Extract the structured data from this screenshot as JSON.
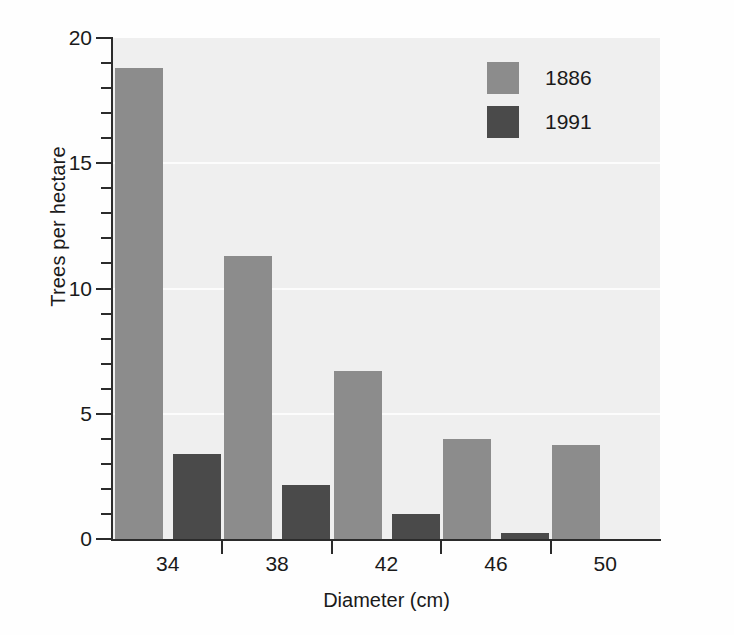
{
  "chart_data": {
    "type": "bar",
    "title": "",
    "xlabel": "Diameter (cm)",
    "ylabel": "Trees per hectare",
    "categories": [
      "34",
      "38",
      "42",
      "46",
      "50"
    ],
    "series": [
      {
        "name": "1886",
        "color": "#8c8c8c",
        "values": [
          18.8,
          11.3,
          6.7,
          4.0,
          3.75
        ]
      },
      {
        "name": "1991",
        "color": "#4a4a4a",
        "values": [
          3.4,
          2.15,
          1.0,
          0.25,
          0
        ]
      }
    ],
    "ylim": [
      0,
      20
    ],
    "ytick_labels": [
      "0",
      "5",
      "10",
      "15",
      "20"
    ],
    "ytick_values": [
      0,
      5,
      10,
      15,
      20
    ],
    "yminor_step": 1,
    "gridlines": [
      5,
      10,
      15
    ],
    "grid": true,
    "grid_color": "#fcfcfc",
    "plot_background": "#efefef",
    "axis_color": "#2b2b2b",
    "legend_position": "top-right"
  }
}
